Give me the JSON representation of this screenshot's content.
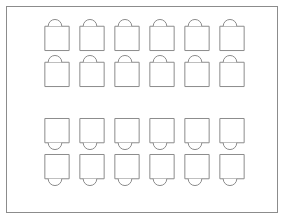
{
  "diagram": {
    "background_color": "#ffffff",
    "stroke_color": "#8c8c8c",
    "fill_color": "#ffffff",
    "canvas": {
      "width": 286,
      "height": 223
    },
    "room_border": {
      "label": "room-outline",
      "x": 6,
      "y": 6,
      "width": 272,
      "height": 207,
      "stroke_width": 1
    },
    "grid": {
      "columns": 6,
      "rows": 4,
      "total_units": 24,
      "column_x": [
        40,
        75,
        110,
        145,
        180,
        215
      ],
      "row_y": [
        26,
        62,
        118,
        154
      ],
      "unit_width": 26,
      "unit_height": 26
    },
    "groups": [
      {
        "name": "upper-block",
        "chair_position": "top",
        "rows": 2,
        "columns": 6,
        "count": 12
      },
      {
        "name": "lower-block",
        "chair_position": "bottom",
        "rows": 2,
        "columns": 6,
        "count": 12
      }
    ],
    "units": [
      {
        "id": "seat-r1c1",
        "row": 1,
        "col": 1,
        "x": 40,
        "y": 26,
        "chair": "top"
      },
      {
        "id": "seat-r1c2",
        "row": 1,
        "col": 2,
        "x": 75,
        "y": 26,
        "chair": "top"
      },
      {
        "id": "seat-r1c3",
        "row": 1,
        "col": 3,
        "x": 110,
        "y": 26,
        "chair": "top"
      },
      {
        "id": "seat-r1c4",
        "row": 1,
        "col": 4,
        "x": 145,
        "y": 26,
        "chair": "top"
      },
      {
        "id": "seat-r1c5",
        "row": 1,
        "col": 5,
        "x": 180,
        "y": 26,
        "chair": "top"
      },
      {
        "id": "seat-r1c6",
        "row": 1,
        "col": 6,
        "x": 215,
        "y": 26,
        "chair": "top"
      },
      {
        "id": "seat-r2c1",
        "row": 2,
        "col": 1,
        "x": 40,
        "y": 62,
        "chair": "top"
      },
      {
        "id": "seat-r2c2",
        "row": 2,
        "col": 2,
        "x": 75,
        "y": 62,
        "chair": "top"
      },
      {
        "id": "seat-r2c3",
        "row": 2,
        "col": 3,
        "x": 110,
        "y": 62,
        "chair": "top"
      },
      {
        "id": "seat-r2c4",
        "row": 2,
        "col": 4,
        "x": 145,
        "y": 62,
        "chair": "top"
      },
      {
        "id": "seat-r2c5",
        "row": 2,
        "col": 5,
        "x": 180,
        "y": 62,
        "chair": "top"
      },
      {
        "id": "seat-r2c6",
        "row": 2,
        "col": 6,
        "x": 215,
        "y": 62,
        "chair": "top"
      },
      {
        "id": "seat-r3c1",
        "row": 3,
        "col": 1,
        "x": 40,
        "y": 118,
        "chair": "bottom"
      },
      {
        "id": "seat-r3c2",
        "row": 3,
        "col": 2,
        "x": 75,
        "y": 118,
        "chair": "bottom"
      },
      {
        "id": "seat-r3c3",
        "row": 3,
        "col": 3,
        "x": 110,
        "y": 118,
        "chair": "bottom"
      },
      {
        "id": "seat-r3c4",
        "row": 3,
        "col": 4,
        "x": 145,
        "y": 118,
        "chair": "bottom"
      },
      {
        "id": "seat-r3c5",
        "row": 3,
        "col": 5,
        "x": 180,
        "y": 118,
        "chair": "bottom"
      },
      {
        "id": "seat-r3c6",
        "row": 3,
        "col": 6,
        "x": 215,
        "y": 118,
        "chair": "bottom"
      },
      {
        "id": "seat-r4c1",
        "row": 4,
        "col": 1,
        "x": 40,
        "y": 154,
        "chair": "bottom"
      },
      {
        "id": "seat-r4c2",
        "row": 4,
        "col": 2,
        "x": 75,
        "y": 154,
        "chair": "bottom"
      },
      {
        "id": "seat-r4c3",
        "row": 4,
        "col": 3,
        "x": 110,
        "y": 154,
        "chair": "bottom"
      },
      {
        "id": "seat-r4c4",
        "row": 4,
        "col": 4,
        "x": 145,
        "y": 154,
        "chair": "bottom"
      },
      {
        "id": "seat-r4c5",
        "row": 4,
        "col": 5,
        "x": 180,
        "y": 154,
        "chair": "bottom"
      },
      {
        "id": "seat-r4c6",
        "row": 4,
        "col": 6,
        "x": 215,
        "y": 154,
        "chair": "bottom"
      }
    ]
  }
}
